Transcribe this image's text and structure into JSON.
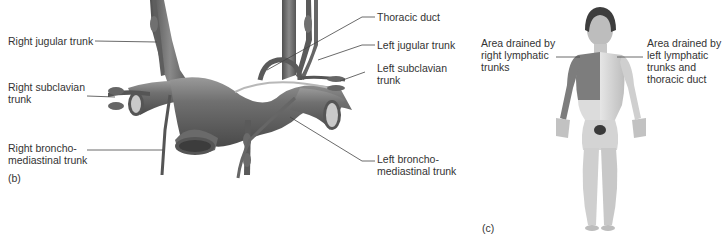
{
  "figure": {
    "panel_b": {
      "tag": "(b)",
      "labels": {
        "right_jugular_trunk": "Right jugular trunk",
        "right_subclavian_trunk": "Right subclavian\ntrunk",
        "right_bronchomediastinal_trunk": "Right broncho-\nmediastinal trunk",
        "thoracic_duct": "Thoracic duct",
        "left_jugular_trunk": "Left jugular trunk",
        "left_subclavian_trunk": "Left subclavian\ntrunk",
        "left_bronchomediastinal_trunk": "Left broncho-\nmediastinal trunk"
      }
    },
    "panel_c": {
      "tag": "(c)",
      "labels": {
        "right_drainage_area": "Area drained by\nright lymphatic\ntrunks",
        "left_drainage_area": "Area drained by\nleft lymphatic\ntrunks and\nthoracic duct"
      }
    },
    "colors": {
      "vessel": "#6e6e6e",
      "vessel_highlight": "#a8a8a8",
      "vessel_dark": "#474747",
      "right_drainage_skin": "#7d7d7d",
      "left_drainage_skin": "#d9d9d9",
      "leader_line": "#444444"
    }
  }
}
